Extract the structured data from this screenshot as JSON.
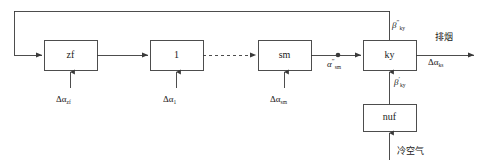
{
  "diagram": {
    "type": "block-flow-diagram",
    "title": "",
    "background_color": "#ffffff",
    "line_color": "#3a3a3a",
    "text_color": "#1a1a1a",
    "blocks": [
      {
        "id": "zf",
        "label": "zf",
        "x": 44,
        "y": 40,
        "w": 53,
        "h": 30
      },
      {
        "id": "one",
        "label": "1",
        "x": 150,
        "y": 40,
        "w": 53,
        "h": 30
      },
      {
        "id": "sm",
        "label": "sm",
        "x": 258,
        "y": 40,
        "w": 53,
        "h": 30
      },
      {
        "id": "ky",
        "label": "ky",
        "x": 363,
        "y": 40,
        "w": 53,
        "h": 30
      },
      {
        "id": "nuf",
        "label": "nuf",
        "x": 363,
        "y": 104,
        "w": 53,
        "h": 27
      }
    ],
    "input_labels": [
      {
        "id": "d-alpha-zf",
        "base": "Δα",
        "sub": "zf",
        "sup": ""
      },
      {
        "id": "d-alpha-1",
        "base": "Δα",
        "sub": "1",
        "sup": ""
      },
      {
        "id": "d-alpha-sm",
        "base": "Δα",
        "sub": "sm",
        "sup": ""
      }
    ],
    "signal_labels": [
      {
        "id": "alpha-sm-dprime",
        "base": "α",
        "sub": "sm",
        "sup": "″"
      },
      {
        "id": "beta-ky-dprime",
        "base": "β",
        "sub": "ky",
        "sup": "″"
      },
      {
        "id": "beta-ky-prime",
        "base": "β",
        "sub": "ky",
        "sup": "′"
      },
      {
        "id": "d-alpha-ks",
        "base": "Δα",
        "sub": "ks",
        "sup": ""
      }
    ],
    "cjk_labels": [
      {
        "id": "exhaust-gas",
        "text": "排烟"
      },
      {
        "id": "cold-air",
        "text": "冷空气"
      }
    ],
    "connector_notes": {
      "dashed_segment": "between block 1 and block sm",
      "feedback_loop": "from ky output top rail back around left into zf input",
      "junction_dot": "on line between sm and ky"
    }
  }
}
